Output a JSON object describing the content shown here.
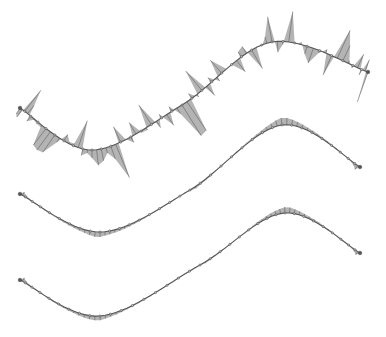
{
  "diagram": {
    "type": "curvature-comb-comparison",
    "background": "#ffffff",
    "curves": [
      {
        "id": "curve-noisy",
        "description": "sine-like curve with irregular, spiky curvature comb",
        "start": [
          20,
          108
        ],
        "trough": [
          92,
          150
        ],
        "inflection": [
          182,
          105
        ],
        "peak": [
          272,
          42
        ],
        "end": [
          368,
          72
        ],
        "comb_style": "noisy",
        "comb_scale": 1.0,
        "color": "#444444"
      },
      {
        "id": "curve-smooth-1",
        "description": "faired sine-like curve with smooth curvature comb",
        "start": [
          20,
          194
        ],
        "trough": [
          100,
          232
        ],
        "inflection": [
          190,
          190
        ],
        "peak": [
          282,
          125
        ],
        "end": [
          360,
          167
        ],
        "comb_style": "smooth",
        "comb_scale": 1.0,
        "color": "#555555"
      },
      {
        "id": "curve-smooth-2",
        "description": "faired sine-like curve with smooth curvature comb",
        "start": [
          20,
          280
        ],
        "trough": [
          100,
          316
        ],
        "inflection": [
          200,
          265
        ],
        "peak": [
          285,
          213
        ],
        "end": [
          360,
          253
        ],
        "comb_style": "smooth",
        "comb_scale": 0.85,
        "color": "#555555"
      }
    ]
  }
}
